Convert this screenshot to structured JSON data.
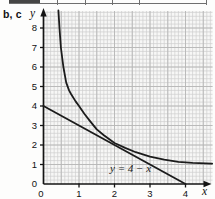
{
  "figure": {
    "panel_label": "b, c"
  },
  "chart_data": {
    "type": "line",
    "title": "",
    "xlabel": "x",
    "ylabel": "y",
    "xlim": [
      0,
      4.75
    ],
    "ylim": [
      0,
      8.87
    ],
    "x_ticks": [
      0,
      1,
      2,
      3,
      4
    ],
    "y_ticks": [
      0,
      1,
      2,
      3,
      4,
      5,
      6,
      7,
      8
    ],
    "grid": {
      "on": true,
      "minor_x": 0.1,
      "minor_y": 0.2,
      "major_x": 0.5,
      "major_y": 1.0
    },
    "legend": "none",
    "series": [
      {
        "name": "curve",
        "points": [
          [
            0.42,
            8.9
          ],
          [
            0.45,
            8.0
          ],
          [
            0.49,
            7.0
          ],
          [
            0.56,
            6.0
          ],
          [
            0.64,
            5.2
          ],
          [
            0.72,
            4.8
          ],
          [
            0.78,
            4.6
          ],
          [
            0.9,
            4.25
          ],
          [
            1.0,
            4.0
          ],
          [
            1.15,
            3.6
          ],
          [
            1.3,
            3.25
          ],
          [
            1.5,
            2.8
          ],
          [
            1.7,
            2.5
          ],
          [
            2.0,
            2.1
          ],
          [
            2.3,
            1.85
          ],
          [
            2.6,
            1.63
          ],
          [
            3.0,
            1.4
          ],
          [
            3.4,
            1.25
          ],
          [
            3.8,
            1.13
          ],
          [
            4.2,
            1.08
          ],
          [
            4.75,
            1.05
          ]
        ]
      },
      {
        "name": "line",
        "points": [
          [
            0,
            4
          ],
          [
            4,
            0
          ]
        ]
      }
    ],
    "annotations": [
      {
        "text": "y = 4 − x",
        "x": 1.9,
        "y": 0.75
      }
    ],
    "colors": {
      "stroke": "#1b1b1b",
      "axis": "#141414",
      "grid_minor": "#cfcfcf",
      "grid_major": "#b7b7b7",
      "plot_bg": "#f7f7f6",
      "text": "#111111"
    }
  }
}
